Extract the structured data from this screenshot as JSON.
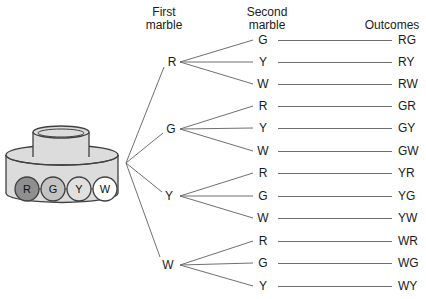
{
  "headers": {
    "first": {
      "line1": "First",
      "line2": "marble"
    },
    "second": {
      "line1": "Second",
      "line2": "marble"
    },
    "outcomes": "Outcomes"
  },
  "jar": {
    "body_color": "#dcdcdc",
    "outline_color": "#404040",
    "marbles": [
      {
        "label": "R",
        "color": "#8f8f8f"
      },
      {
        "label": "G",
        "color": "#c3c3c3"
      },
      {
        "label": "Y",
        "color": "#e0e0e0"
      },
      {
        "label": "W",
        "color": "#ffffff"
      }
    ]
  },
  "tree": {
    "line_color": "#6f6f6f",
    "first_level": [
      {
        "label": "R",
        "branches": [
          {
            "second": "G",
            "outcome": "RG"
          },
          {
            "second": "Y",
            "outcome": "RY"
          },
          {
            "second": "W",
            "outcome": "RW"
          }
        ]
      },
      {
        "label": "G",
        "branches": [
          {
            "second": "R",
            "outcome": "GR"
          },
          {
            "second": "Y",
            "outcome": "GY"
          },
          {
            "second": "W",
            "outcome": "GW"
          }
        ]
      },
      {
        "label": "Y",
        "branches": [
          {
            "second": "R",
            "outcome": "YR"
          },
          {
            "second": "G",
            "outcome": "YG"
          },
          {
            "second": "W",
            "outcome": "YW"
          }
        ]
      },
      {
        "label": "W",
        "branches": [
          {
            "second": "R",
            "outcome": "WR"
          },
          {
            "second": "G",
            "outcome": "WG"
          },
          {
            "second": "Y",
            "outcome": "WY"
          }
        ]
      }
    ]
  }
}
